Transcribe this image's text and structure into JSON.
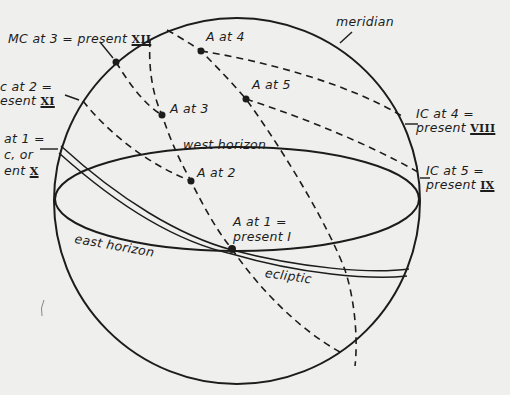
{
  "figure": {
    "type": "celestial-sphere-diagram",
    "background_color": "#efefed",
    "ink_color": "#1c1c1c"
  },
  "labels": {
    "meridian": "meridian",
    "west_horizon": "west horizon",
    "east_horizon": "east horizon",
    "ecliptic": "ecliptic",
    "mc_at_3": {
      "text": "MC at 3 = present ",
      "roman": "XII"
    },
    "ic_at_2": {
      "line1": "c at 2 =",
      "line2_text": "esent ",
      "roman": "XI"
    },
    "at_1": {
      "line1": "at 1 =",
      "line2": "c, or",
      "line3_text": "ent ",
      "roman": "X"
    },
    "ic_at_4": {
      "line1": "IC at 4 =",
      "line2_text": "present ",
      "roman": "VIII"
    },
    "ic_at_5": {
      "line1": "IC at 5 =",
      "line2_text": "present ",
      "roman": "IX"
    },
    "a_at_1": {
      "line1": "A at 1 =",
      "line2": "present I"
    },
    "a_at_2": "A at 2",
    "a_at_3": "A at 3",
    "a_at_4": "A at 4",
    "a_at_5": "A at 5"
  },
  "points": [
    {
      "name": "MC at 3",
      "x": 116,
      "y": 62
    },
    {
      "name": "A at 4",
      "x": 201,
      "y": 51
    },
    {
      "name": "A at 5",
      "x": 246,
      "y": 99
    },
    {
      "name": "A at 3",
      "x": 162,
      "y": 115
    },
    {
      "name": "A at 2",
      "x": 191,
      "y": 181
    },
    {
      "name": "A at 1",
      "x": 232,
      "y": 249
    }
  ]
}
